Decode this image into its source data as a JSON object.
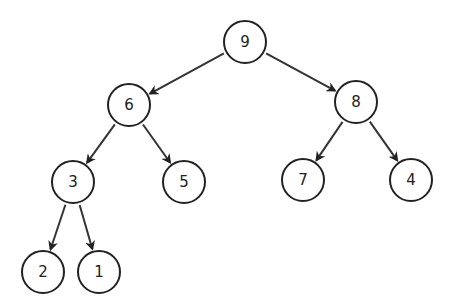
{
  "diagram": {
    "type": "binary-tree",
    "nodes": [
      {
        "id": "n9",
        "label": "9",
        "x": 245,
        "y": 42
      },
      {
        "id": "n6",
        "label": "6",
        "x": 129,
        "y": 105
      },
      {
        "id": "n8",
        "label": "8",
        "x": 356,
        "y": 102
      },
      {
        "id": "n3",
        "label": "3",
        "x": 73,
        "y": 182
      },
      {
        "id": "n5",
        "label": "5",
        "x": 184,
        "y": 182
      },
      {
        "id": "n7",
        "label": "7",
        "x": 303,
        "y": 180
      },
      {
        "id": "n4",
        "label": "4",
        "x": 411,
        "y": 180
      },
      {
        "id": "n2",
        "label": "2",
        "x": 43,
        "y": 272
      },
      {
        "id": "n1",
        "label": "1",
        "x": 99,
        "y": 272
      }
    ],
    "edges": [
      {
        "from": "n9",
        "to": "n6"
      },
      {
        "from": "n9",
        "to": "n8"
      },
      {
        "from": "n6",
        "to": "n3"
      },
      {
        "from": "n6",
        "to": "n5"
      },
      {
        "from": "n8",
        "to": "n7"
      },
      {
        "from": "n8",
        "to": "n4"
      },
      {
        "from": "n3",
        "to": "n2"
      },
      {
        "from": "n3",
        "to": "n1"
      }
    ],
    "node_radius": 21
  }
}
